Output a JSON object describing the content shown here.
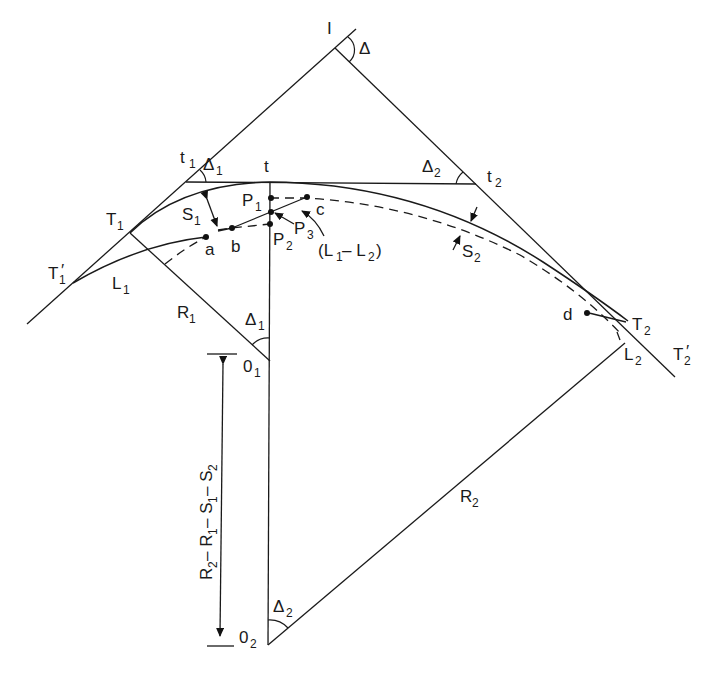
{
  "diagram": {
    "stroke_color": "#1a1a1a",
    "background": "#ffffff"
  },
  "labels": {
    "I": "I",
    "Delta": "Δ",
    "t1_main": "t",
    "t1_sub": "1",
    "delta1_top_main": "Δ",
    "delta1_top_sub": "1",
    "t": "t",
    "delta2_top_main": "Δ",
    "delta2_top_sub": "2",
    "t2_main": "t",
    "t2_sub": "2",
    "T1_main": "T",
    "T1_sub": "1",
    "S1_main": "S",
    "S1_sub": "1",
    "P1_main": "P",
    "P1_sub": "1",
    "P2_main": "P",
    "P2_sub": "2",
    "P3_main": "P",
    "P3_sub": "3",
    "c": "c",
    "a": "a",
    "b": "b",
    "L1L2_open": "(L",
    "L1L2_sub1": "1",
    "L1L2_mid": " – L",
    "L1L2_sub2": "2",
    "L1L2_close": ")",
    "S2_main": "S",
    "S2_sub": "2",
    "T1p_main": "T",
    "T1p_sub": "1",
    "T1p_prime": "′",
    "L1_main": "L",
    "L1_sub": "1",
    "R1_main": "R",
    "R1_sub": "1",
    "delta1_low_main": "Δ",
    "delta1_low_sub": "1",
    "O1_main": "0",
    "O1_sub": "1",
    "d": "d",
    "T2_main": "T",
    "T2_sub": "2",
    "L2_main": "L",
    "L2_sub": "2",
    "T2p_main": "T",
    "T2p_sub": "2",
    "T2p_prime": "′",
    "R2_main": "R",
    "R2_sub": "2",
    "delta2_low_main": "Δ",
    "delta2_low_sub": "2",
    "O2_main": "0",
    "O2_sub": "2",
    "dim_R2": "R",
    "dim_R2_sub": "2",
    "dim_m1": " – R",
    "dim_R1_sub": "1",
    "dim_m2": " – S",
    "dim_S1_sub": "1",
    "dim_m3": " – S",
    "dim_S2_sub": "2"
  }
}
